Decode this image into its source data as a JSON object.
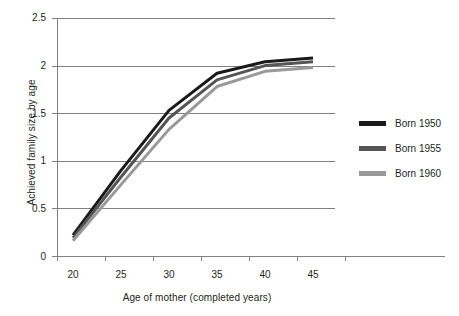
{
  "chart_data": {
    "type": "line",
    "title": "",
    "xlabel": "Age of mother (completed years)",
    "ylabel": "Achieved family size by age",
    "x": [
      20,
      25,
      30,
      35,
      40,
      45
    ],
    "xtick_labels": [
      "20",
      "25",
      "30",
      "35",
      "40",
      "45"
    ],
    "ytick_labels": [
      "0",
      "0.5",
      "1",
      "1.5",
      "2",
      "2.5"
    ],
    "yticks": [
      0,
      0.5,
      1,
      1.5,
      2,
      2.5
    ],
    "xlim": [
      20,
      45
    ],
    "ylim": [
      0,
      2.5
    ],
    "grid": "horizontal",
    "legend_position": "right",
    "series": [
      {
        "name": "Born 1950",
        "color": "#1a1a1a",
        "values": [
          0.22,
          0.9,
          1.53,
          1.92,
          2.04,
          2.08
        ]
      },
      {
        "name": "Born 1955",
        "color": "#555555",
        "values": [
          0.19,
          0.83,
          1.45,
          1.85,
          2.0,
          2.04
        ]
      },
      {
        "name": "Born 1960",
        "color": "#999999",
        "values": [
          0.16,
          0.75,
          1.33,
          1.78,
          1.94,
          1.98
        ]
      }
    ]
  },
  "axes": {
    "y_title": "Achieved family size by age",
    "x_title": "Age of mother (completed years)",
    "ytick_0": "0",
    "ytick_1": "0.5",
    "ytick_2": "1",
    "ytick_3": "1.5",
    "ytick_4": "2",
    "ytick_5": "2.5",
    "xtick_0": "20",
    "xtick_1": "25",
    "xtick_2": "30",
    "xtick_3": "35",
    "xtick_4": "40",
    "xtick_5": "45"
  },
  "legend": {
    "items": [
      {
        "label": "Born 1950",
        "color": "#1a1a1a"
      },
      {
        "label": "Born 1955",
        "color": "#555555"
      },
      {
        "label": "Born 1960",
        "color": "#999999"
      }
    ]
  }
}
